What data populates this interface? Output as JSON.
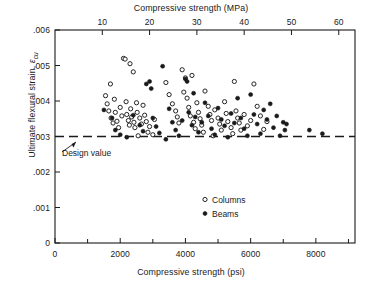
{
  "chart_data": {
    "type": "scatter",
    "title": "",
    "xlabel": "Compressive strength (psi)",
    "xlabel_top": "Compressive strength (MPa)",
    "ylabel": "Ultimate flexural strain, εcu",
    "xlim": [
      0,
      9200
    ],
    "ylim": [
      0,
      0.006
    ],
    "xticks": [
      0,
      2000,
      4000,
      6000,
      8000
    ],
    "xtick_labels": [
      "0",
      "2000",
      "4000",
      "6000",
      "8000"
    ],
    "xminor_step": 1000,
    "xticks_top_mpa": [
      10,
      20,
      30,
      40,
      50,
      60
    ],
    "xtick_labels_top": [
      "10",
      "20",
      "30",
      "40",
      "50",
      "60"
    ],
    "yticks": [
      0,
      0.001,
      0.002,
      0.003,
      0.004,
      0.005,
      0.006
    ],
    "ytick_labels": [
      "0",
      ".001",
      ".002",
      ".003",
      ".004",
      ".005",
      ".006"
    ],
    "grid": false,
    "legend_position": "center-right-lower",
    "annotation": {
      "text": "Design value",
      "y": 0.003,
      "line_style": "dashed"
    },
    "design_value": 0.003,
    "mpa_per_psi": 0.00689476,
    "series": [
      {
        "name": "Columns",
        "marker": "open-circle",
        "color": "#1a1a1a",
        "points": [
          [
            1550,
            0.00415
          ],
          [
            1600,
            0.00392
          ],
          [
            1650,
            0.00372
          ],
          [
            1700,
            0.00448
          ],
          [
            1720,
            0.00352
          ],
          [
            1780,
            0.00338
          ],
          [
            1820,
            0.00405
          ],
          [
            1850,
            0.00368
          ],
          [
            1900,
            0.00343
          ],
          [
            1950,
            0.00325
          ],
          [
            2000,
            0.00382
          ],
          [
            2050,
            0.00358
          ],
          [
            2100,
            0.0052
          ],
          [
            2150,
            0.00518
          ],
          [
            2180,
            0.00398
          ],
          [
            2200,
            0.00362
          ],
          [
            2250,
            0.00345
          ],
          [
            2280,
            0.00332
          ],
          [
            2300,
            0.00505
          ],
          [
            2320,
            0.00378
          ],
          [
            2350,
            0.00355
          ],
          [
            2400,
            0.00482
          ],
          [
            2420,
            0.0034
          ],
          [
            2450,
            0.00325
          ],
          [
            2500,
            0.00395
          ],
          [
            2520,
            0.00368
          ],
          [
            2550,
            0.00302
          ],
          [
            2600,
            0.00352
          ],
          [
            2650,
            0.00335
          ],
          [
            2700,
            0.00388
          ],
          [
            2750,
            0.0036
          ],
          [
            2800,
            0.00342
          ],
          [
            2850,
            0.00312
          ],
          [
            2900,
            0.00328
          ],
          [
            3000,
            0.00305
          ],
          [
            3050,
            0.00348
          ],
          [
            3400,
            0.00452
          ],
          [
            3500,
            0.00418
          ],
          [
            3600,
            0.00392
          ],
          [
            3700,
            0.00372
          ],
          [
            3750,
            0.00355
          ],
          [
            3800,
            0.00338
          ],
          [
            3900,
            0.00488
          ],
          [
            3950,
            0.00425
          ],
          [
            4000,
            0.00465
          ],
          [
            4050,
            0.00408
          ],
          [
            4100,
            0.00382
          ],
          [
            4150,
            0.00358
          ],
          [
            4200,
            0.00472
          ],
          [
            4250,
            0.0034
          ],
          [
            4300,
            0.00322
          ],
          [
            4350,
            0.00395
          ],
          [
            4400,
            0.00368
          ],
          [
            4450,
            0.0035
          ],
          [
            4500,
            0.00332
          ],
          [
            4550,
            0.00312
          ],
          [
            4600,
            0.00428
          ],
          [
            4700,
            0.00385
          ],
          [
            4750,
            0.00362
          ],
          [
            4800,
            0.00345
          ],
          [
            4850,
            0.00302
          ],
          [
            4900,
            0.00375
          ],
          [
            5000,
            0.00352
          ],
          [
            5050,
            0.00335
          ],
          [
            5100,
            0.00318
          ],
          [
            5200,
            0.00398
          ],
          [
            5250,
            0.00365
          ],
          [
            5300,
            0.00342
          ],
          [
            5400,
            0.00325
          ],
          [
            5450,
            0.00308
          ],
          [
            5500,
            0.00455
          ],
          [
            5550,
            0.00372
          ],
          [
            5600,
            0.00352
          ],
          [
            5650,
            0.00338
          ],
          [
            5700,
            0.00318
          ],
          [
            5800,
            0.00362
          ],
          [
            5900,
            0.0033
          ],
          [
            6000,
            0.00345
          ],
          [
            6100,
            0.00448
          ],
          [
            6200,
            0.00385
          ],
          [
            6300,
            0.00358
          ],
          [
            6400,
            0.0032
          ],
          [
            6500,
            0.00342
          ]
        ]
      },
      {
        "name": "Beams",
        "marker": "filled-circle",
        "color": "#1a1a1a",
        "points": [
          [
            1500,
            0.00375
          ],
          [
            1750,
            0.00352
          ],
          [
            1850,
            0.00318
          ],
          [
            2000,
            0.00305
          ],
          [
            2200,
            0.00298
          ],
          [
            2400,
            0.0036
          ],
          [
            2600,
            0.00332
          ],
          [
            2700,
            0.00315
          ],
          [
            2800,
            0.00448
          ],
          [
            2900,
            0.00455
          ],
          [
            2950,
            0.00435
          ],
          [
            3000,
            0.00352
          ],
          [
            3100,
            0.00328
          ],
          [
            3200,
            0.0031
          ],
          [
            3300,
            0.00498
          ],
          [
            3400,
            0.00292
          ],
          [
            3500,
            0.00378
          ],
          [
            3600,
            0.0034
          ],
          [
            3700,
            0.00318
          ],
          [
            3800,
            0.00302
          ],
          [
            3900,
            0.00345
          ],
          [
            4000,
            0.00462
          ],
          [
            4050,
            0.00455
          ],
          [
            4100,
            0.00368
          ],
          [
            4200,
            0.00332
          ],
          [
            4250,
            0.00422
          ],
          [
            4300,
            0.00355
          ],
          [
            4400,
            0.00312
          ],
          [
            4500,
            0.0034
          ],
          [
            4600,
            0.00395
          ],
          [
            4700,
            0.00358
          ],
          [
            4800,
            0.00322
          ],
          [
            4900,
            0.00305
          ],
          [
            5000,
            0.0038
          ],
          [
            5100,
            0.00348
          ],
          [
            5200,
            0.0033
          ],
          [
            5300,
            0.00298
          ],
          [
            5400,
            0.00365
          ],
          [
            5500,
            0.00338
          ],
          [
            5600,
            0.00408
          ],
          [
            5700,
            0.00352
          ],
          [
            5800,
            0.00322
          ],
          [
            5900,
            0.00302
          ],
          [
            6000,
            0.00418
          ],
          [
            6100,
            0.00362
          ],
          [
            6200,
            0.00335
          ],
          [
            6300,
            0.00308
          ],
          [
            6400,
            0.00375
          ],
          [
            6500,
            0.00348
          ],
          [
            6600,
            0.00392
          ],
          [
            6700,
            0.00325
          ],
          [
            6800,
            0.00358
          ],
          [
            6900,
            0.00302
          ],
          [
            7000,
            0.0034
          ],
          [
            7050,
            0.00318
          ],
          [
            7100,
            0.00335
          ],
          [
            7800,
            0.00318
          ],
          [
            8200,
            0.00308
          ]
        ]
      }
    ]
  },
  "legend": {
    "items": [
      {
        "label": "Columns",
        "marker": "open-circle"
      },
      {
        "label": "Beams",
        "marker": "filled-circle"
      }
    ]
  }
}
